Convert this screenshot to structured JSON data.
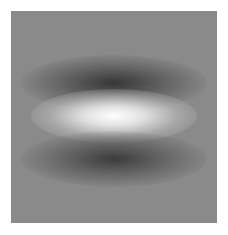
{
  "image": {
    "description": "Grayscale Gabor-like filter pattern: horizontal bright central band flanked by dark bands above and below on a mid-gray square",
    "colors": {
      "background": "#ffffff",
      "panel": "#8a8a8a",
      "bright_center": "#ffffff",
      "dark_band": "#282828"
    }
  }
}
